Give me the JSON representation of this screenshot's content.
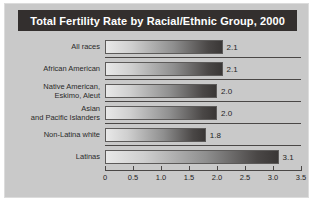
{
  "chart_data": {
    "type": "bar",
    "orientation": "horizontal",
    "title": "Total Fertility Rate by Racial/Ethnic Group, 2000",
    "xlabel": "",
    "ylabel": "",
    "xlim": [
      0,
      3.5
    ],
    "xticks": [
      "0",
      "0.5",
      "1.0",
      "1.5",
      "2.0",
      "2.5",
      "3.0",
      "3.5"
    ],
    "xtick_values": [
      0,
      0.5,
      1.0,
      1.5,
      2.0,
      2.5,
      3.0,
      3.5
    ],
    "grid": false,
    "legend": false,
    "categories": [
      "All races",
      "African American",
      "Native American,\nEskimo, Aleut",
      "Asian\nand Pacific Islanders",
      "Non-Latina white",
      "Latinas"
    ],
    "values": [
      2.1,
      2.1,
      2.0,
      2.0,
      1.8,
      3.1
    ],
    "value_labels": [
      "2.1",
      "2.1",
      "2.0",
      "2.0",
      "1.8",
      "3.1"
    ]
  },
  "categories_lines": [
    [
      "All races"
    ],
    [
      "African American"
    ],
    [
      "Native American,",
      "Eskimo, Aleut"
    ],
    [
      "Asian",
      "and Pacific Islanders"
    ],
    [
      "Non-Latina white"
    ],
    [
      "Latinas"
    ]
  ],
  "colors": {
    "panel_background": "#c9c9c9",
    "panel_border": "#dcdcdc",
    "title_background": "#332f2e",
    "title_text": "#ffffff",
    "bar_gradient_start": "#e8e8e8",
    "bar_gradient_end": "#3a3736",
    "axis": "#4a4746",
    "text": "#1f1f1f"
  }
}
